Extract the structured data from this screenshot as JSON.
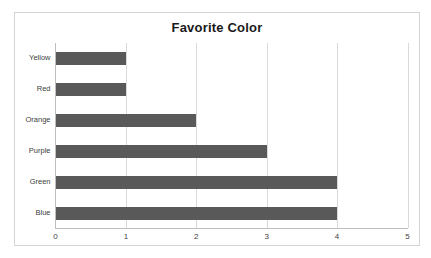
{
  "chart_data": {
    "type": "bar",
    "orientation": "horizontal",
    "title": "Favorite Color",
    "xlabel": "",
    "ylabel": "",
    "categories": [
      "Yellow",
      "Red",
      "Orange",
      "Purple",
      "Green",
      "Blue"
    ],
    "values": [
      1,
      1,
      2,
      3,
      4,
      4
    ],
    "xlim": [
      0,
      5
    ],
    "xticks": [
      "0",
      "1",
      "2",
      "3",
      "4",
      "5"
    ],
    "grid": "vertical",
    "legend": "none",
    "bar_color": "#595959",
    "gridline_color": "#d9d9d9",
    "axis_color": "#bfbfbf",
    "border_color": "#d4d4d4",
    "background": "#ffffff",
    "title_color": "#1a1a1a",
    "label_color": "#404040"
  }
}
